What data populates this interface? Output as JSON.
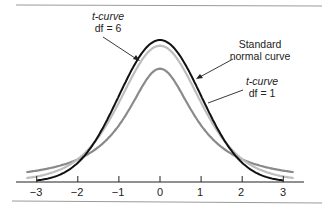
{
  "chart_data": {
    "type": "line",
    "title": "",
    "xlabel": "",
    "ylabel": "",
    "xlim": [
      -3.2,
      3.2
    ],
    "x_ticks": [
      -3,
      -2,
      -1,
      0,
      1,
      2,
      3
    ],
    "x_tick_labels": [
      "−3",
      "−2",
      "−1",
      "0",
      "1",
      "2",
      "3"
    ],
    "grid": false,
    "series": [
      {
        "name": "Standard normal curve",
        "color": "#111111",
        "dist": "normal",
        "peak": 0.399
      },
      {
        "name": "t-curve df = 6",
        "color": "#bdbdbd",
        "dist": "t",
        "df": 6,
        "peak": 0.383
      },
      {
        "name": "t-curve df = 1",
        "color": "#8a8a8a",
        "dist": "t",
        "df": 1,
        "peak": 0.318
      }
    ],
    "annotations": [
      {
        "text": "t-curve df = 6",
        "points_to": "t-curve df = 6 near x = -0.45"
      },
      {
        "text": "Standard normal curve",
        "points_to": "normal curve near x = 0.9"
      },
      {
        "text": "t-curve df = 1",
        "points_to": "t-curve df = 1 near x = 0.95"
      }
    ]
  },
  "labels": {
    "t6_line1": "t-curve",
    "t6_line2": "df = 6",
    "normal_line1": "Standard",
    "normal_line2": "normal curve",
    "t1_line1": "t-curve",
    "t1_line2": "df = 1"
  },
  "ticks": [
    "−3",
    "−2",
    "−1",
    "0",
    "1",
    "2",
    "3"
  ]
}
